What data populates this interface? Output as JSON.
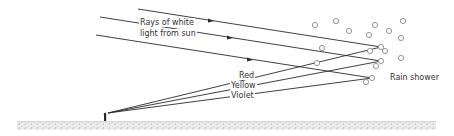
{
  "labels": {
    "rays_line1": "Rays of white",
    "rays_line2": "light from sun",
    "red": "Red",
    "yellow": "Yellow",
    "violet": "Violet",
    "rain": "Rain shower"
  },
  "colors": {
    "line": "#2a2a2a",
    "drop": "#888888",
    "ground": "#cfcfcf"
  }
}
